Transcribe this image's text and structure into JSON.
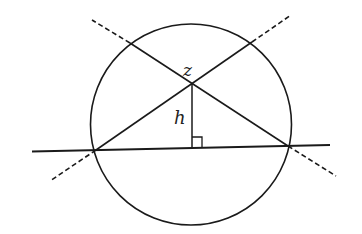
{
  "diagram": {
    "labels": {
      "intersection": "z",
      "height": "h"
    },
    "circle": {
      "cx": 191,
      "cy": 124.5,
      "r": 100.5
    },
    "points": {
      "z": [
        192,
        84
      ],
      "left_base": [
        96,
        150
      ],
      "right_base": [
        288,
        146
      ],
      "top_left": [
        130,
        43
      ],
      "top_right": [
        252,
        42
      ],
      "foot": [
        192,
        147.5
      ]
    },
    "secant": {
      "x1": 32,
      "y1": 151.5,
      "x2": 330,
      "y2": 145
    },
    "dashed_extensions": [
      {
        "x1": 252,
        "y1": 42,
        "x2": 291,
        "y2": 15
      },
      {
        "x1": 96,
        "y1": 150,
        "x2": 50,
        "y2": 181
      },
      {
        "x1": 130,
        "y1": 43,
        "x2": 92,
        "y2": 20
      },
      {
        "x1": 288,
        "y1": 146,
        "x2": 336,
        "y2": 176
      }
    ],
    "right_angle_marker": {
      "x": 192,
      "y": 137,
      "size": 10
    },
    "colors": {
      "stroke": "#1a1a1a",
      "background": "#ffffff"
    }
  }
}
